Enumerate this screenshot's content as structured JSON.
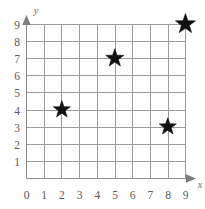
{
  "chart_data": {
    "type": "scatter",
    "title": "",
    "xlabel": "x",
    "ylabel": "y",
    "xlim": [
      0,
      9
    ],
    "ylim": [
      0,
      9
    ],
    "grid": true,
    "legend": null,
    "marker": "star",
    "x_ticks": [
      "0",
      "1",
      "2",
      "3",
      "4",
      "5",
      "6",
      "7",
      "8",
      "9"
    ],
    "y_ticks": [
      "0",
      "1",
      "2",
      "3",
      "4",
      "5",
      "6",
      "7",
      "8",
      "9"
    ],
    "x": [
      2,
      5,
      8,
      9
    ],
    "y": [
      4,
      7,
      3,
      9
    ],
    "points": [
      {
        "x": 2,
        "y": 4,
        "label": "(2, 4)",
        "size": 13
      },
      {
        "x": 5,
        "y": 7,
        "label": "(5, 7)",
        "size": 14
      },
      {
        "x": 8,
        "y": 3,
        "label": "(8, 3)",
        "size": 13
      },
      {
        "x": 9,
        "y": 9,
        "label": "(9, 9)",
        "size": 16
      }
    ],
    "colors": {
      "marker": "#111111",
      "gridline": "#9b9b9b",
      "axis": "#8e8e8e",
      "tick_label": "#5a5a5a",
      "background": "#fefefe"
    }
  },
  "axes": {
    "x_axis_title": "x",
    "y_axis_title": "y"
  }
}
